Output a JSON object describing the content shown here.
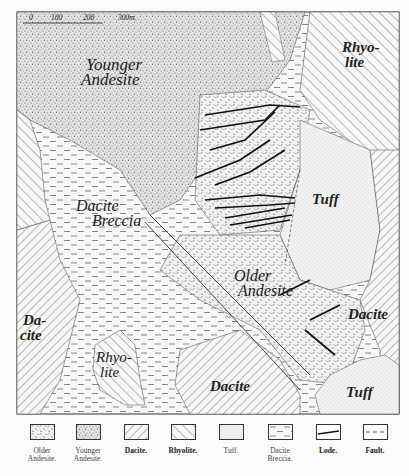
{
  "map": {
    "scale_bar": {
      "ticks": [
        "0",
        "100",
        "200",
        "300m."
      ]
    },
    "labels": {
      "younger_andesite": [
        "Younger",
        "Andesite"
      ],
      "rhyolite_ne": [
        "Rhyo-",
        "lite"
      ],
      "dacite_breccia": [
        "Dacite",
        "Breccia"
      ],
      "tuff_center": "Tuff",
      "older_andesite": [
        "Older",
        "Andesite"
      ],
      "dacite_east": "Dacite",
      "dacite_west": [
        "Da-",
        "cite"
      ],
      "rhyolite_sw": [
        "Rhyo-",
        "lite"
      ],
      "dacite_south": "Dacite",
      "tuff_se": "Tuff"
    }
  },
  "legend": {
    "items": [
      {
        "key": "older-andesite",
        "label": [
          "Older",
          "Andesite."
        ]
      },
      {
        "key": "younger-andesite",
        "label": [
          "Younger",
          "Andesite."
        ]
      },
      {
        "key": "dacite",
        "label": [
          "Dacite."
        ]
      },
      {
        "key": "rhyolite",
        "label": [
          "Rhyolite."
        ]
      },
      {
        "key": "tuff",
        "label": [
          "Tuff."
        ]
      },
      {
        "key": "dacite-breccia",
        "label": [
          "Dacite",
          "Breccia."
        ]
      },
      {
        "key": "lode",
        "label": [
          "Lode."
        ]
      },
      {
        "key": "fault",
        "label": [
          "Fault."
        ]
      }
    ]
  }
}
